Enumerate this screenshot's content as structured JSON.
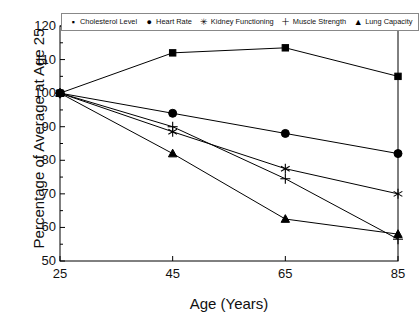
{
  "chart_data": {
    "type": "line",
    "title": "",
    "xlabel": "Age (Years)",
    "ylabel": "Percentage of Average at Age 25",
    "x": [
      25,
      45,
      65,
      85
    ],
    "xticklabels": [
      "25",
      "45",
      "65",
      "85"
    ],
    "yticklabels": [
      "50",
      "60",
      "70",
      "80",
      "90",
      "100",
      "110",
      "120"
    ],
    "xlim": [
      25,
      85
    ],
    "ylim": [
      50,
      120
    ],
    "grid": false,
    "legend_position": "top-center-inside",
    "series": [
      {
        "name": "Cholesterol Level",
        "marker": "square",
        "values": [
          100,
          112,
          113.5,
          105
        ]
      },
      {
        "name": "Heart Rate",
        "marker": "circle",
        "values": [
          100,
          94,
          88,
          82
        ]
      },
      {
        "name": "Kidney Functioning",
        "marker": "asterisk",
        "values": [
          100,
          88.5,
          77.5,
          70
        ]
      },
      {
        "name": "Muscle Strength",
        "marker": "plus",
        "values": [
          100,
          90,
          74.5,
          56.5
        ]
      },
      {
        "name": "Lung Capacity",
        "marker": "triangle",
        "values": [
          100,
          82,
          62.5,
          58
        ]
      }
    ],
    "line_color": "#000000",
    "axis_color": "#000000"
  },
  "axes": {
    "y_title": "Percentage of Average at Age 25",
    "x_title": "Age (Years)",
    "y_ticks": [
      "120",
      "110",
      "100",
      "90",
      "80",
      "70",
      "60",
      "50"
    ],
    "x_ticks": [
      "25",
      "45",
      "65",
      "85"
    ]
  },
  "legend": {
    "items": [
      {
        "label": "Cholesterol Level",
        "glyph": "▪",
        "icon": "square-marker-icon"
      },
      {
        "label": "Heart Rate",
        "glyph": "●",
        "icon": "circle-marker-icon"
      },
      {
        "label": "Kidney Functioning",
        "glyph": "✳",
        "icon": "asterisk-marker-icon"
      },
      {
        "label": "Muscle Strength",
        "glyph": "＋",
        "icon": "plus-marker-icon"
      },
      {
        "label": "Lung Capacity",
        "glyph": "▲",
        "icon": "triangle-marker-icon"
      }
    ]
  }
}
